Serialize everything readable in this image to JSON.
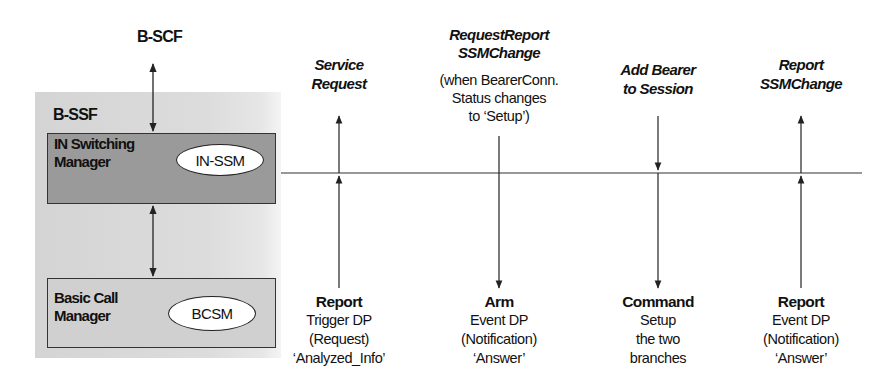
{
  "diagram": {
    "top_entity": {
      "label": "B-SCF"
    },
    "container": {
      "label": "B-SSF",
      "boxes": [
        {
          "title_line1": "IN Switching",
          "title_line2": "Manager",
          "state_machine": "IN-SSM"
        },
        {
          "title_line1": "Basic Call",
          "title_line2": "Manager",
          "state_machine": "BCSM"
        }
      ]
    },
    "messages": [
      {
        "top_lines": [
          "Service",
          "Request"
        ],
        "top_sub_lines": [],
        "direction": "up",
        "bottom_title": "Report",
        "bottom_lines": [
          "Trigger DP",
          "(Request)",
          "‘Analyzed_Info’"
        ]
      },
      {
        "top_lines": [
          "RequestReport",
          "SSMChange"
        ],
        "top_sub_lines": [
          "(when BearerConn.",
          "Status changes",
          "to ‘Setup’)"
        ],
        "direction": "down",
        "bottom_title": "Arm",
        "bottom_lines": [
          "Event DP",
          "(Notification)",
          "‘Answer’"
        ]
      },
      {
        "top_lines": [
          "Add Bearer",
          "to Session"
        ],
        "top_sub_lines": [],
        "direction": "down",
        "bottom_title": "Command",
        "bottom_lines": [
          "Setup",
          "the two",
          "branches"
        ]
      },
      {
        "top_lines": [
          "Report",
          "SSMChange"
        ],
        "top_sub_lines": [],
        "direction": "up",
        "bottom_title": "Report",
        "bottom_lines": [
          "Event DP",
          "(Notification)",
          "‘Answer’"
        ]
      }
    ]
  },
  "colors": {
    "container_bg": "#d8d8d8",
    "ism_box_bg": "#9a9a9a",
    "bcm_box_bg": "#d0d0d0",
    "line": "#222222"
  }
}
